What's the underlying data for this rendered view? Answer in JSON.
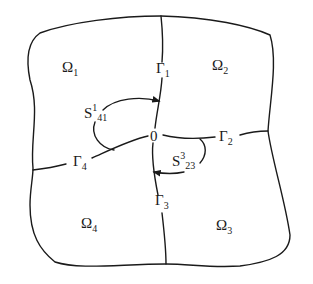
{
  "diagram": {
    "type": "domain-decomposition",
    "center": {
      "label": "0"
    },
    "regions": [
      {
        "name": "Ω",
        "index": "1"
      },
      {
        "name": "Ω",
        "index": "2"
      },
      {
        "name": "Ω",
        "index": "3"
      },
      {
        "name": "Ω",
        "index": "4"
      }
    ],
    "interfaces": [
      {
        "name": "Γ",
        "index": "1"
      },
      {
        "name": "Γ",
        "index": "2"
      },
      {
        "name": "Γ",
        "index": "3"
      },
      {
        "name": "Γ",
        "index": "4"
      }
    ],
    "arcs": [
      {
        "name": "S",
        "sup": "1",
        "sub": "41"
      },
      {
        "name": "S",
        "sup": "3",
        "sub": "23"
      }
    ],
    "colors": {
      "stroke": "#1a1a1a",
      "background": "#ffffff"
    }
  }
}
